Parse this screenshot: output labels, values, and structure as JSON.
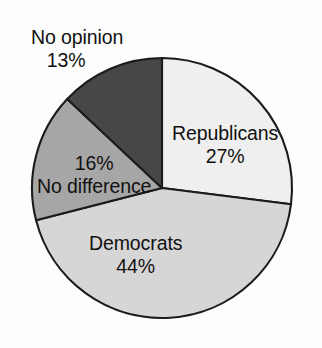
{
  "background_color": "#fdfdfd",
  "chart_data": {
    "type": "pie",
    "title": "",
    "subtitle": "",
    "xlabel": "",
    "ylabel": "",
    "legend_position": "none",
    "grid": false,
    "units": "percent",
    "total": 100,
    "start_angle_deg": 0,
    "direction": "clockwise",
    "categories": [
      "Republicans",
      "Democrats",
      "No difference",
      "No opinion"
    ],
    "values": [
      27,
      44,
      16,
      13
    ],
    "value_labels": [
      "27%",
      "44%",
      "16%",
      "13%"
    ],
    "colors": [
      "#f0efef",
      "#d7d6d6",
      "#a7a6a6",
      "#474747"
    ],
    "outline_color": "#1b1b1b",
    "slices": [
      {
        "name": "Republicans",
        "value": 27,
        "value_label": "27%",
        "color": "#f0efef",
        "start_deg": 0,
        "end_deg": 97.2,
        "label_placement": "inside",
        "label_order": "name-then-percent"
      },
      {
        "name": "Democrats",
        "value": 44,
        "value_label": "44%",
        "color": "#d7d6d6",
        "start_deg": 97.2,
        "end_deg": 255.6,
        "label_placement": "inside",
        "label_order": "name-then-percent"
      },
      {
        "name": "No difference",
        "value": 16,
        "value_label": "16%",
        "color": "#a7a6a6",
        "start_deg": 255.6,
        "end_deg": 313.2,
        "label_placement": "inside",
        "label_order": "percent-then-name"
      },
      {
        "name": "No opinion",
        "value": 13,
        "value_label": "13%",
        "color": "#474747",
        "start_deg": 313.2,
        "end_deg": 360,
        "label_placement": "outside",
        "label_order": "name-then-percent"
      }
    ]
  }
}
